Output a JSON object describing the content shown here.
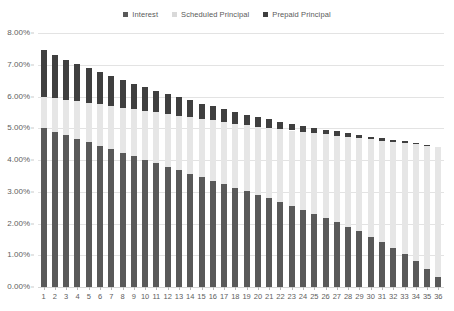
{
  "chart_data": {
    "type": "bar",
    "subtype": "stacked-column",
    "title": "",
    "xlabel": "",
    "ylabel": "",
    "ylim": [
      0,
      0.08
    ],
    "ytick_labels": [
      "0.00%",
      "1.00%",
      "2.00%",
      "3.00%",
      "4.00%",
      "5.00%",
      "6.00%",
      "7.00%",
      "8.00%"
    ],
    "ytick_values": [
      0.0,
      0.01,
      0.02,
      0.03,
      0.04,
      0.05,
      0.06,
      0.07,
      0.08
    ],
    "grid": true,
    "legend_position": "top-center",
    "categories": [
      "1",
      "2",
      "3",
      "4",
      "5",
      "6",
      "7",
      "8",
      "9",
      "10",
      "11",
      "12",
      "13",
      "14",
      "15",
      "16",
      "17",
      "18",
      "19",
      "20",
      "21",
      "22",
      "23",
      "24",
      "25",
      "26",
      "27",
      "28",
      "29",
      "30",
      "31",
      "32",
      "33",
      "34",
      "35",
      "36"
    ],
    "series": [
      {
        "name": "Interest",
        "color": "#595959",
        "values": [
          0.05,
          0.0489,
          0.0478,
          0.0467,
          0.0456,
          0.0445,
          0.0434,
          0.0423,
          0.0412,
          0.0401,
          0.039,
          0.0379,
          0.0368,
          0.0357,
          0.0346,
          0.0335,
          0.0324,
          0.0313,
          0.0302,
          0.0291,
          0.028,
          0.0268,
          0.0256,
          0.0244,
          0.0231,
          0.0218,
          0.0204,
          0.019,
          0.0175,
          0.0159,
          0.0142,
          0.0124,
          0.0104,
          0.0082,
          0.0058,
          0.0031
        ]
      },
      {
        "name": "Scheduled Principal",
        "color": "#e6e6e6",
        "values": [
          0.01,
          0.0106,
          0.0112,
          0.0118,
          0.0124,
          0.013,
          0.0136,
          0.0142,
          0.0148,
          0.0154,
          0.016,
          0.0166,
          0.0172,
          0.0178,
          0.0184,
          0.019,
          0.0196,
          0.0202,
          0.0208,
          0.0214,
          0.0221,
          0.0229,
          0.0237,
          0.0245,
          0.0254,
          0.0263,
          0.0273,
          0.0283,
          0.0294,
          0.0306,
          0.0319,
          0.0333,
          0.0349,
          0.0367,
          0.0387,
          0.041
        ]
      },
      {
        "name": "Prepaid Principal",
        "color": "#3f3f3f",
        "values": [
          0.0145,
          0.0135,
          0.0126,
          0.0117,
          0.0109,
          0.0101,
          0.0094,
          0.0087,
          0.008,
          0.0074,
          0.0068,
          0.0063,
          0.0058,
          0.0053,
          0.0048,
          0.0044,
          0.004,
          0.0036,
          0.0033,
          0.003,
          0.0027,
          0.0024,
          0.0022,
          0.0019,
          0.0017,
          0.0015,
          0.0013,
          0.0012,
          0.001,
          0.0009,
          0.0008,
          0.0007,
          0.0006,
          0.0004,
          0.0003,
          0.0
        ]
      }
    ],
    "totals": [
      0.0745,
      0.073,
      0.0716,
      0.0702,
      0.0689,
      0.0676,
      0.0664,
      0.0652,
      0.064,
      0.0629,
      0.0618,
      0.0608,
      0.0598,
      0.0588,
      0.0578,
      0.0569,
      0.056,
      0.0551,
      0.0543,
      0.0535,
      0.0528,
      0.0521,
      0.0515,
      0.0508,
      0.0502,
      0.0496,
      0.049,
      0.0485,
      0.0479,
      0.0474,
      0.0469,
      0.0464,
      0.0459,
      0.0453,
      0.0448,
      0.0441
    ]
  },
  "legend": {
    "items": [
      {
        "label": "Interest",
        "color": "#595959"
      },
      {
        "label": "Scheduled Principal",
        "color": "#d9d9d9"
      },
      {
        "label": "Prepaid Principal",
        "color": "#3f3f3f"
      }
    ]
  }
}
